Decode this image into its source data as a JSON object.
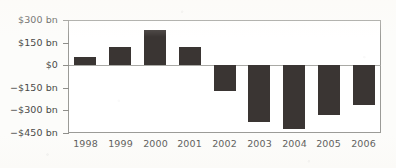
{
  "chart_data": {
    "type": "bar",
    "title": "",
    "subtitle": "",
    "xlabel": "",
    "ylabel": "",
    "categories": [
      "1998",
      "1999",
      "2000",
      "2001",
      "2002",
      "2003",
      "2004",
      "2005",
      "2006"
    ],
    "values": [
      55,
      120,
      233,
      118,
      -175,
      -375,
      -425,
      -330,
      -265
    ],
    "unit": "bn",
    "currency": "$",
    "value_labels": [
      "$55 bn",
      "$120 bn",
      "$233 bn",
      "$118 bn",
      "-$175 bn",
      "-$375 bn",
      "-$425 bn",
      "-$330 bn",
      "-$265 bn"
    ],
    "ylim": [
      -450,
      300
    ],
    "ytick_values": [
      300,
      150,
      0,
      -150,
      -300,
      -450
    ],
    "ytick_labels": [
      "$300 bn",
      "$150 bn",
      "$0",
      "−$150 bn",
      "−$300 bn",
      "−$450 bn"
    ],
    "xtick_labels": [
      "1998",
      "1999",
      "2000",
      "2001",
      "2002",
      "2003",
      "2004",
      "2005",
      "2006"
    ],
    "grid": false,
    "legend": null,
    "legend_position": "none",
    "annotations": [],
    "series": [
      {
        "name": "value",
        "values": [
          55,
          120,
          233,
          118,
          -175,
          -375,
          -425,
          -330,
          -265
        ],
        "color": "#3a3533"
      }
    ],
    "colors": {
      "bar": "#3a3533",
      "axis": "#9b9b97",
      "zero_line": "#a9a9a5",
      "tick_text": "#4a4a48",
      "plot_background": "#ffffff",
      "figure_background": "#fcfcfa"
    }
  }
}
